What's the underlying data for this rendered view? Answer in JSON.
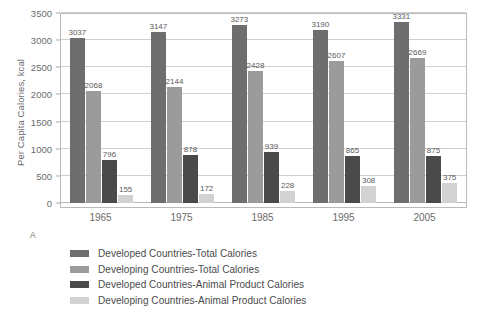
{
  "figure": {
    "panel_letter": "A"
  },
  "chart_data": {
    "type": "bar",
    "title": "",
    "xlabel": "",
    "ylabel": "Per Capita Calories, kcal",
    "ylim": [
      0,
      3500
    ],
    "ytick_values": [
      0,
      500,
      1000,
      1500,
      2000,
      2500,
      3000,
      3500
    ],
    "ytick_labels": [
      "0",
      "500",
      "1000",
      "1500",
      "2000",
      "2500",
      "3000",
      "3500"
    ],
    "grid": true,
    "legend_position": "below",
    "categories": [
      "1965",
      "1975",
      "1985",
      "1995",
      "2005"
    ],
    "series": [
      {
        "name": "Developed Countries-Total Calories",
        "color": "#6e6e6e",
        "values": [
          3037,
          3147,
          3273,
          3190,
          3331
        ],
        "labels": [
          "3037",
          "3147",
          "3273",
          "3190",
          "3331"
        ]
      },
      {
        "name": "Developing Countries-Total Calories",
        "color": "#9b9b9b",
        "values": [
          2068,
          2144,
          2428,
          2607,
          2669
        ],
        "labels": [
          "2068",
          "2144",
          "2428",
          "2607",
          "2669"
        ]
      },
      {
        "name": "Developed Countries-Animal Product Calories",
        "color": "#4a4a4a",
        "values": [
          796,
          878,
          939,
          865,
          875
        ],
        "labels": [
          "796",
          "878",
          "939",
          "865",
          "875"
        ]
      },
      {
        "name": "Developing Countries-Animal Product Calories",
        "color": "#d2d2d2",
        "values": [
          155,
          172,
          228,
          308,
          375
        ],
        "labels": [
          "155",
          "172",
          "228",
          "308",
          "375"
        ]
      }
    ]
  }
}
